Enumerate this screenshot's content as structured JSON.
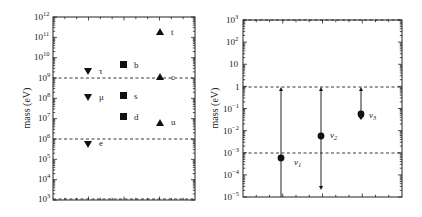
{
  "chart_data": [
    {
      "type": "scatter",
      "panel": "left",
      "title": "",
      "xlabel": "",
      "ylabel": "mass (eV)",
      "yscale": "log",
      "ylim": [
        1000.0,
        1000000000000.0
      ],
      "ytick_labels": [
        "10^12",
        "10^11",
        "10^10",
        "10^9",
        "10^8",
        "10^7",
        "10^6",
        "10^5",
        "10^4",
        "10^3"
      ],
      "dashed_lines": [
        1000000000.0,
        1000000.0,
        1000.0
      ],
      "grid": false,
      "series": [
        {
          "name": "charged leptons",
          "marker": "triangle-down",
          "column": 1,
          "points": [
            {
              "label": "τ",
              "value": 1800000000.0
            },
            {
              "label": "μ",
              "value": 110000000.0
            },
            {
              "label": "e",
              "value": 510000.0
            }
          ]
        },
        {
          "name": "down-type quarks",
          "marker": "square",
          "column": 2,
          "points": [
            {
              "label": "b",
              "value": 4200000000.0
            },
            {
              "label": "s",
              "value": 100000000.0
            },
            {
              "label": "d",
              "value": 10000000.0
            }
          ]
        },
        {
          "name": "up-type quarks",
          "marker": "triangle-up",
          "column": 3,
          "points": [
            {
              "label": "t",
              "value": 170000000000.0
            },
            {
              "label": "c",
              "value": 1300000000.0
            },
            {
              "label": "u",
              "value": 4000000.0
            }
          ]
        }
      ]
    },
    {
      "type": "scatter",
      "panel": "right",
      "title": "",
      "xlabel": "",
      "ylabel": "mass (eV)",
      "yscale": "log",
      "ylim": [
        1e-05,
        1000.0
      ],
      "ytick_labels": [
        "10^3",
        "10^2",
        "10",
        "1",
        "10^-1",
        "10^-2",
        "10^-3",
        "10^-4",
        "10^-5"
      ],
      "dashed_lines": [
        1000.0,
        1,
        0.001
      ],
      "grid": false,
      "series": [
        {
          "name": "neutrinos",
          "marker": "circle",
          "points": [
            {
              "label": "ν1",
              "value": 0.0007,
              "range": [
                1e-05,
                1
              ],
              "upper_arrow": true,
              "lower_arrow": false
            },
            {
              "label": "ν2",
              "value": 0.006,
              "range": [
                2.5e-05,
                1
              ],
              "upper_arrow": true,
              "lower_arrow": true
            },
            {
              "label": "ν3",
              "value": 0.05,
              "range": [
                0.04,
                1
              ],
              "upper_arrow": true,
              "lower_arrow": false
            }
          ]
        }
      ]
    }
  ],
  "left": {
    "ylabel": "mass (eV)",
    "ticks": [
      {
        "base": "10",
        "exp": "12"
      },
      {
        "base": "10",
        "exp": "11"
      },
      {
        "base": "10",
        "exp": "10"
      },
      {
        "base": "10",
        "exp": "9"
      },
      {
        "base": "10",
        "exp": "8"
      },
      {
        "base": "10",
        "exp": "7"
      },
      {
        "base": "10",
        "exp": "6"
      },
      {
        "base": "10",
        "exp": "5"
      },
      {
        "base": "10",
        "exp": "4"
      },
      {
        "base": "10",
        "exp": "3"
      }
    ],
    "labels": {
      "tau": "τ",
      "mu": "μ",
      "e": "e",
      "b": "b",
      "s": "s",
      "d": "d",
      "t": "t",
      "c": "c",
      "u": "u"
    }
  },
  "right": {
    "ylabel": "mass (eV)",
    "ticks": [
      {
        "base": "10",
        "exp": "3"
      },
      {
        "base": "10",
        "exp": "2"
      },
      {
        "base": "10",
        "exp": ""
      },
      {
        "base": "1",
        "exp": ""
      },
      {
        "base": "10",
        "exp": "−1"
      },
      {
        "base": "10",
        "exp": "−2"
      },
      {
        "base": "10",
        "exp": "−3"
      },
      {
        "base": "10",
        "exp": "−4"
      },
      {
        "base": "10",
        "exp": "−5"
      }
    ],
    "labels": {
      "nu1": "ν",
      "nu1_sub": "1",
      "nu2": "ν",
      "nu2_sub": "2",
      "nu3": "ν",
      "nu3_sub": "3"
    }
  }
}
